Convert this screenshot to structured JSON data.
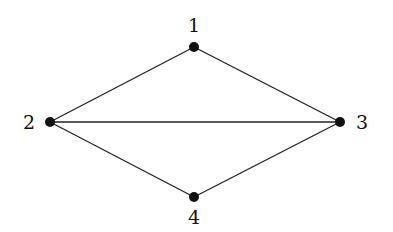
{
  "diagram": {
    "type": "undirected-graph",
    "nodes": [
      {
        "id": "1",
        "label": "1",
        "x": 194,
        "y": 47,
        "lx": 194,
        "ly": 32
      },
      {
        "id": "2",
        "label": "2",
        "x": 50,
        "y": 122,
        "lx": 29,
        "ly": 129
      },
      {
        "id": "3",
        "label": "3",
        "x": 340,
        "y": 122,
        "lx": 362,
        "ly": 129
      },
      {
        "id": "4",
        "label": "4",
        "x": 194,
        "y": 197,
        "lx": 194,
        "ly": 224
      }
    ],
    "edges": [
      {
        "from": "1",
        "to": "2"
      },
      {
        "from": "1",
        "to": "3"
      },
      {
        "from": "2",
        "to": "3"
      },
      {
        "from": "2",
        "to": "4"
      },
      {
        "from": "3",
        "to": "4"
      }
    ],
    "colors": {
      "node": "#111111",
      "edge": "#222222",
      "background": "#ffffff"
    }
  }
}
